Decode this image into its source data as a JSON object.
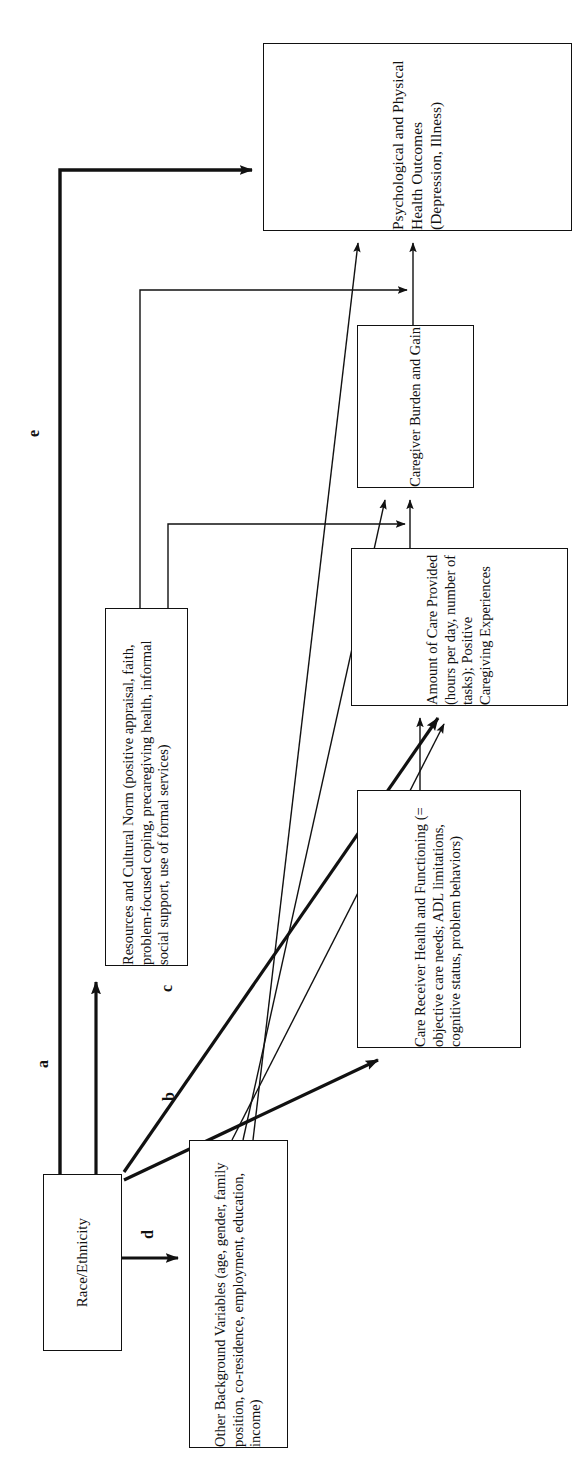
{
  "figure": {
    "type": "conceptual-path-diagram",
    "orientation": "rotated-90-ccw",
    "background": "#ffffff",
    "line_color": "#111111"
  },
  "nodes": [
    {
      "id": "outcomes",
      "name": "psychological-physical-health-outcomes",
      "label": "Psychological and Physical Health Outcomes (Depression, Illness)"
    },
    {
      "id": "burden",
      "name": "caregiver-burden-and-gain",
      "label": "Caregiver Burden and Gain"
    },
    {
      "id": "amount",
      "name": "amount-of-care-provided",
      "label": "Amount of Care Provided (hours per day, number of tasks); Positive Caregiving Experiences"
    },
    {
      "id": "receiver",
      "name": "care-receiver-health-and-functioning",
      "label": "Care Receiver Health and Functioning (= objective care needs; ADL limitations, cognitive status, problem behaviors)"
    },
    {
      "id": "resources",
      "name": "resources-and-cultural-norm",
      "label": "Resources and Cultural Norm (positive appraisal, faith, problem-focused coping, precaregiving health, informal social support, use of formal services)"
    },
    {
      "id": "race",
      "name": "race-ethnicity",
      "label": "Race/Ethnicity"
    },
    {
      "id": "other",
      "name": "other-background-variables",
      "label": "Other Background Variables (age, gender, family position, co-residence, employment, education, income)"
    }
  ],
  "edge_labels": {
    "a": "a",
    "b": "b",
    "c": "c",
    "d": "d",
    "e": "e"
  },
  "edges": [
    {
      "id": "a",
      "from": "race",
      "to": "resources",
      "label": "a",
      "weight": "thick"
    },
    {
      "id": "b",
      "from": "race",
      "to": "receiver",
      "label": "b",
      "weight": "thick"
    },
    {
      "id": "c",
      "from": "race",
      "to": "amount",
      "label": "c",
      "weight": "thick"
    },
    {
      "id": "d",
      "from": "race",
      "to": "other",
      "label": "d",
      "weight": "thick"
    },
    {
      "id": "e",
      "from": "race",
      "to": "outcomes",
      "label": "e",
      "weight": "thick"
    },
    {
      "id": "f1",
      "from": "resources",
      "to": "outcomes",
      "label": "",
      "weight": "thin"
    },
    {
      "id": "f2",
      "from": "resources",
      "to": "burden",
      "label": "",
      "weight": "thin"
    },
    {
      "id": "f3",
      "from": "receiver",
      "to": "amount",
      "label": "",
      "weight": "thin"
    },
    {
      "id": "f4",
      "from": "amount",
      "to": "burden",
      "label": "",
      "weight": "thin"
    },
    {
      "id": "f5",
      "from": "burden",
      "to": "outcomes",
      "label": "",
      "weight": "thin"
    },
    {
      "id": "f6",
      "from": "other",
      "to": "amount",
      "label": "",
      "weight": "thin"
    },
    {
      "id": "f7",
      "from": "other",
      "to": "burden",
      "label": "",
      "weight": "thin"
    },
    {
      "id": "f8",
      "from": "other",
      "to": "outcomes",
      "label": "",
      "weight": "thin"
    }
  ]
}
